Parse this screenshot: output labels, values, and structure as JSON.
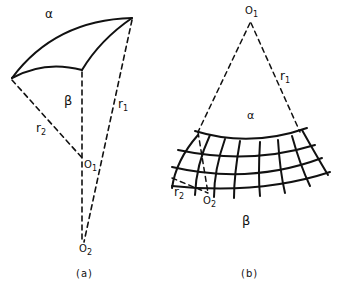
{
  "figure_a": {
    "caption": "(a)",
    "labels": {
      "alpha": "α",
      "beta": "β",
      "r1": "r",
      "r1_sub": "1",
      "r2": "r",
      "r2_sub": "2",
      "o1": "O",
      "o1_sub": "1",
      "o2": "O",
      "o2_sub": "2"
    }
  },
  "figure_b": {
    "caption": "(b)",
    "labels": {
      "o1": "O",
      "o1_sub": "1",
      "r1": "r",
      "r1_sub": "1",
      "alpha": "α",
      "beta": "β",
      "r2": "r",
      "r2_sub": "2",
      "o2": "O",
      "o2_sub": "2"
    }
  },
  "colors": {
    "ink": "#111111",
    "background": "#ffffff"
  }
}
